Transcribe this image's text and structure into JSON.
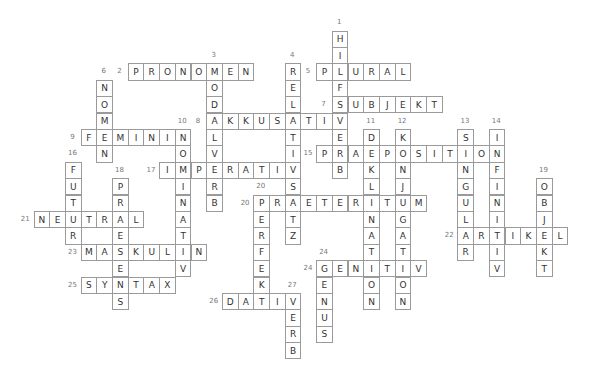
{
  "puzzle": {
    "type": "crossword",
    "grid": {
      "cell_width": 15.7,
      "cell_height": 16.4,
      "origin_x": 33.5,
      "origin_y": 30.5
    },
    "words": [
      {
        "number": "1",
        "answer": "HILFSVERB",
        "direction": "down",
        "row": 0,
        "col": 19
      },
      {
        "number": "2",
        "answer": "PRONOMEN",
        "direction": "across",
        "row": 2,
        "col": 6
      },
      {
        "number": "3",
        "answer": "MODALVERB",
        "direction": "down",
        "row": 2,
        "col": 11
      },
      {
        "number": "4",
        "answer": "RELATIVSATZ",
        "direction": "down",
        "row": 2,
        "col": 16
      },
      {
        "number": "5",
        "answer": "PLURAL",
        "direction": "across",
        "row": 2,
        "col": 18
      },
      {
        "number": "6",
        "answer": "NOMEN",
        "direction": "down",
        "row": 3,
        "col": 4
      },
      {
        "number": "7",
        "answer": "SUBJEKT",
        "direction": "across",
        "row": 4,
        "col": 19
      },
      {
        "number": "8",
        "answer": "AKKUSATIV",
        "direction": "across",
        "row": 5,
        "col": 11
      },
      {
        "number": "9",
        "answer": "FEMININ",
        "direction": "across",
        "row": 6,
        "col": 3
      },
      {
        "number": "10",
        "answer": "NOMINATIV",
        "direction": "down",
        "row": 6,
        "col": 9
      },
      {
        "number": "11",
        "answer": "DEKLINATION",
        "direction": "down",
        "row": 6,
        "col": 21
      },
      {
        "number": "12",
        "answer": "KONJUGATION",
        "direction": "down",
        "row": 6,
        "col": 23
      },
      {
        "number": "13",
        "answer": "SINGULAR",
        "direction": "down",
        "row": 6,
        "col": 27
      },
      {
        "number": "14",
        "answer": "INFINITIV",
        "direction": "down",
        "row": 6,
        "col": 29
      },
      {
        "number": "15",
        "answer": "PRAEPOSITION",
        "direction": "across",
        "row": 7,
        "col": 18
      },
      {
        "number": "16",
        "answer": "FUTUR",
        "direction": "down",
        "row": 8,
        "col": 2
      },
      {
        "number": "17",
        "answer": "IMPERATIV",
        "direction": "across",
        "row": 8,
        "col": 8
      },
      {
        "number": "18",
        "answer": "PRAESENS",
        "direction": "down",
        "row": 9,
        "col": 5
      },
      {
        "number": "19",
        "answer": "OBJEKT",
        "direction": "down",
        "row": 9,
        "col": 32
      },
      {
        "number": "20",
        "answer": "PERFEKT",
        "direction": "down",
        "row": 10,
        "col": 14
      },
      {
        "number": "20",
        "answer": "PRAETERITUM",
        "direction": "across",
        "row": 10,
        "col": 14
      },
      {
        "number": "21",
        "answer": "NEUTRAL",
        "direction": "across",
        "row": 11,
        "col": 0
      },
      {
        "number": "22",
        "answer": "ARTIKEL",
        "direction": "across",
        "row": 12,
        "col": 27
      },
      {
        "number": "23",
        "answer": "MASKULIN",
        "direction": "across",
        "row": 13,
        "col": 3
      },
      {
        "number": "24",
        "answer": "GENUS",
        "direction": "down",
        "row": 14,
        "col": 18
      },
      {
        "number": "24",
        "answer": "GENITIV",
        "direction": "across",
        "row": 14,
        "col": 18
      },
      {
        "number": "25",
        "answer": "SYNTAX",
        "direction": "across",
        "row": 15,
        "col": 3
      },
      {
        "number": "26",
        "answer": "DATIV",
        "direction": "across",
        "row": 16,
        "col": 12
      },
      {
        "number": "27",
        "answer": "VERB",
        "direction": "down",
        "row": 16,
        "col": 16
      }
    ],
    "colors": {
      "cell_border": "#9a9a9a",
      "letter": "#333333",
      "number": "#777777",
      "background": "#ffffff"
    }
  }
}
